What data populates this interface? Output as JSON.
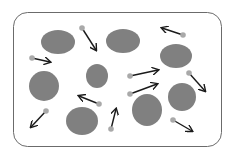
{
  "diagram": {
    "colors": {
      "background": "#ffffff",
      "container_stroke": "#6b6b6b",
      "large_particle": "#808080",
      "small_particle": "#a9a9a9",
      "arrow": "#1a1a1a"
    },
    "container": {
      "x": 13,
      "y": 12,
      "w": 208,
      "h": 134,
      "r": 14
    },
    "large_particles": [
      {
        "cx": 58,
        "cy": 42,
        "rx": 17,
        "ry": 12
      },
      {
        "cx": 123,
        "cy": 41,
        "rx": 17,
        "ry": 12
      },
      {
        "cx": 176,
        "cy": 56,
        "rx": 16,
        "ry": 12
      },
      {
        "cx": 44,
        "cy": 86,
        "rx": 15,
        "ry": 15
      },
      {
        "cx": 97,
        "cy": 76,
        "rx": 11,
        "ry": 12
      },
      {
        "cx": 82,
        "cy": 121,
        "rx": 16,
        "ry": 14
      },
      {
        "cx": 147,
        "cy": 110,
        "rx": 15,
        "ry": 16
      },
      {
        "cx": 182,
        "cy": 97,
        "rx": 14,
        "ry": 14
      }
    ],
    "small_particles": [
      {
        "x": 82,
        "y": 28,
        "ax": 96,
        "ay": 50
      },
      {
        "x": 32,
        "y": 58,
        "ax": 50,
        "ay": 62
      },
      {
        "x": 183,
        "y": 35,
        "ax": 162,
        "ay": 28
      },
      {
        "x": 130,
        "y": 76,
        "ax": 158,
        "ay": 70
      },
      {
        "x": 130,
        "y": 94,
        "ax": 157,
        "ay": 84
      },
      {
        "x": 189,
        "y": 73,
        "ax": 205,
        "ay": 91
      },
      {
        "x": 46,
        "y": 111,
        "ax": 31,
        "ay": 127
      },
      {
        "x": 99,
        "y": 104,
        "ax": 79,
        "ay": 96
      },
      {
        "x": 111,
        "y": 129,
        "ax": 116,
        "ay": 109
      },
      {
        "x": 173,
        "y": 120,
        "ax": 192,
        "ay": 131
      }
    ]
  }
}
